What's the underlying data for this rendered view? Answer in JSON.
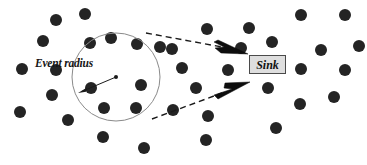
{
  "figure": {
    "title": "",
    "width": 367,
    "height": 165,
    "background_color": "#ffffff",
    "labels": {
      "event_radius": "Event radius",
      "sink": "Sink"
    },
    "colors": {
      "node_fill": "#242424",
      "circle_stroke": "#8a8a8a",
      "dashed_line": "#1a1a1a",
      "arrow_fill": "#0d0d0d",
      "sink_box_fill": "#dedede",
      "sink_box_border": "#4a4a4a",
      "text": "#151515"
    },
    "event_circle": {
      "cx": 116,
      "cy": 77,
      "r": 44
    },
    "radius_indicator": {
      "center_x": 116,
      "center_y": 77,
      "arrow_tip_x": 78,
      "arrow_tip_y": 93
    },
    "sink_box": {
      "x": 249,
      "y": 55,
      "width": 37,
      "height": 19
    },
    "dashed_rays": [
      {
        "x1": 146,
        "y1": 33,
        "x2": 222,
        "y2": 47
      },
      {
        "x1": 152,
        "y1": 119,
        "x2": 222,
        "y2": 93
      }
    ],
    "nodes": [
      {
        "x": 56,
        "y": 20,
        "r": 6
      },
      {
        "x": 85,
        "y": 14,
        "r": 6
      },
      {
        "x": 111,
        "y": 38,
        "r": 6
      },
      {
        "x": 137,
        "y": 44,
        "r": 6
      },
      {
        "x": 43,
        "y": 41,
        "r": 6
      },
      {
        "x": 90,
        "y": 43,
        "r": 6
      },
      {
        "x": 160,
        "y": 47,
        "r": 6
      },
      {
        "x": 22,
        "y": 69,
        "r": 6
      },
      {
        "x": 56,
        "y": 70,
        "r": 6
      },
      {
        "x": 91,
        "y": 88,
        "r": 6
      },
      {
        "x": 141,
        "y": 85,
        "r": 6
      },
      {
        "x": 104,
        "y": 108,
        "r": 6
      },
      {
        "x": 136,
        "y": 108,
        "r": 6
      },
      {
        "x": 52,
        "y": 95,
        "r": 6
      },
      {
        "x": 20,
        "y": 112,
        "r": 6
      },
      {
        "x": 68,
        "y": 120,
        "r": 6
      },
      {
        "x": 103,
        "y": 137,
        "r": 6
      },
      {
        "x": 144,
        "y": 148,
        "r": 6
      },
      {
        "x": 207,
        "y": 29,
        "r": 6
      },
      {
        "x": 249,
        "y": 28,
        "r": 6
      },
      {
        "x": 172,
        "y": 49,
        "r": 6
      },
      {
        "x": 182,
        "y": 68,
        "r": 6
      },
      {
        "x": 228,
        "y": 70,
        "r": 6
      },
      {
        "x": 196,
        "y": 88,
        "r": 6
      },
      {
        "x": 173,
        "y": 110,
        "r": 6
      },
      {
        "x": 208,
        "y": 116,
        "r": 6
      },
      {
        "x": 206,
        "y": 140,
        "r": 6
      },
      {
        "x": 241,
        "y": 48,
        "r": 6
      },
      {
        "x": 301,
        "y": 15,
        "r": 6
      },
      {
        "x": 345,
        "y": 15,
        "r": 6
      },
      {
        "x": 272,
        "y": 42,
        "r": 6
      },
      {
        "x": 321,
        "y": 50,
        "r": 6
      },
      {
        "x": 301,
        "y": 69,
        "r": 6
      },
      {
        "x": 345,
        "y": 70,
        "r": 6
      },
      {
        "x": 268,
        "y": 88,
        "r": 6
      },
      {
        "x": 334,
        "y": 97,
        "r": 6
      },
      {
        "x": 300,
        "y": 104,
        "r": 6
      },
      {
        "x": 276,
        "y": 128,
        "r": 6
      },
      {
        "x": 359,
        "y": 46,
        "r": 6
      }
    ],
    "arrow_heads": [
      {
        "name": "upper-arrowhead",
        "points": "218,40 248,54 221,53 215,48 224,47 214,42"
      },
      {
        "name": "lower-arrowhead",
        "points": "218,99 250,82 225,83 224,88 232,89 214,95"
      }
    ]
  }
}
